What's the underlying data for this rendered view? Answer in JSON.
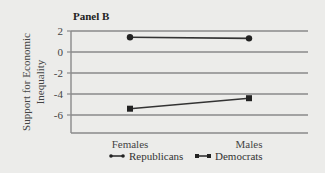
{
  "chart_data": {
    "type": "line",
    "title": "Panel B",
    "xlabel": "",
    "ylabel": "Support for Economic Inequality",
    "categories": [
      "Females",
      "Males"
    ],
    "ylim": [
      -7.6,
      2
    ],
    "yticks": [
      2,
      0,
      -2,
      -4,
      -6
    ],
    "ytick_labels": [
      "2",
      "0",
      "-2",
      "-4",
      "-6"
    ],
    "grid": true,
    "legend_position": "bottom",
    "series": [
      {
        "name": "Republicans",
        "marker": "circle",
        "values": [
          1.4,
          1.3
        ]
      },
      {
        "name": "Democrats",
        "marker": "square",
        "values": [
          -5.4,
          -4.4
        ]
      }
    ],
    "colors": {
      "line": "#333333",
      "grid": "#8a8a8a",
      "background": "#ececea"
    }
  }
}
